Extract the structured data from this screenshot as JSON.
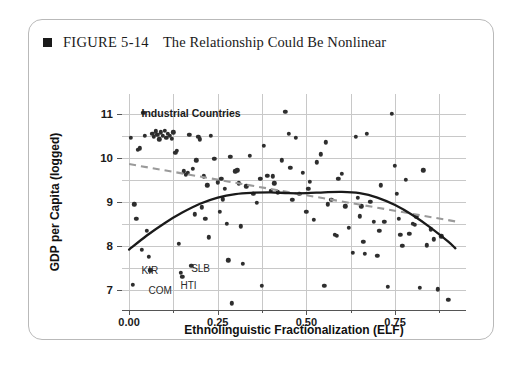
{
  "figure": {
    "bullet": "black-square",
    "number": "FIGURE 5-14",
    "title": "The Relationship Could Be Nonlinear"
  },
  "chart_data": {
    "type": "scatter",
    "title": "The Relationship Could Be Nonlinear",
    "xlabel": "Ethnolinguistic Fractionalization (ELF)",
    "ylabel": "GDP per Capita (logged)",
    "xlim": [
      -0.02,
      0.95
    ],
    "ylim": [
      6.55,
      11.45
    ],
    "xticks": [
      "0.00",
      "0.25",
      "0.50",
      "0.75"
    ],
    "xtick_values": [
      0.0,
      0.25,
      0.5,
      0.75
    ],
    "yticks": [
      "7",
      "8",
      "9",
      "10",
      "11"
    ],
    "ytick_values": [
      7,
      8,
      9,
      10,
      11
    ],
    "grid": true,
    "grid_h_values": [
      7,
      7.5,
      8,
      8.5,
      9,
      9.5,
      10,
      10.5,
      11
    ],
    "grid_v_values": [
      0.0,
      0.125,
      0.25,
      0.375,
      0.5,
      0.625,
      0.75,
      0.875
    ],
    "legend": "none",
    "colors": {
      "point": "#2e2e2e",
      "loess_curve": "#1a1a1a",
      "linear_fit": "#9a9a9a",
      "grid": "#c8c8c8",
      "axis": "#555555",
      "card_border": "#b9b9b9"
    },
    "annotations": [
      {
        "text": "Industrial Countries",
        "x": 0.035,
        "y": 11.16
      },
      {
        "text": "KIR",
        "x": 0.035,
        "y": 7.58
      },
      {
        "text": "SLB",
        "x": 0.175,
        "y": 7.62
      },
      {
        "text": "COM",
        "x": 0.055,
        "y": 7.12
      },
      {
        "text": "HTI",
        "x": 0.145,
        "y": 7.22
      }
    ],
    "points": [
      [
        0.005,
        10.45
      ],
      [
        0.01,
        7.12
      ],
      [
        0.015,
        8.95
      ],
      [
        0.02,
        8.62
      ],
      [
        0.025,
        10.18
      ],
      [
        0.03,
        10.22
      ],
      [
        0.035,
        7.92
      ],
      [
        0.04,
        11.02
      ],
      [
        0.045,
        10.5
      ],
      [
        0.05,
        8.35
      ],
      [
        0.055,
        7.76
      ],
      [
        0.06,
        7.45
      ],
      [
        0.065,
        10.55
      ],
      [
        0.07,
        10.48
      ],
      [
        0.075,
        10.6
      ],
      [
        0.08,
        10.52
      ],
      [
        0.085,
        10.42
      ],
      [
        0.09,
        10.58
      ],
      [
        0.095,
        10.5
      ],
      [
        0.1,
        10.62
      ],
      [
        0.105,
        10.45
      ],
      [
        0.11,
        10.55
      ],
      [
        0.115,
        10.5
      ],
      [
        0.12,
        10.44
      ],
      [
        0.125,
        10.58
      ],
      [
        0.13,
        10.12
      ],
      [
        0.135,
        10.16
      ],
      [
        0.14,
        8.05
      ],
      [
        0.145,
        7.4
      ],
      [
        0.15,
        7.3
      ],
      [
        0.155,
        9.7
      ],
      [
        0.16,
        9.62
      ],
      [
        0.165,
        9.66
      ],
      [
        0.17,
        10.52
      ],
      [
        0.175,
        7.55
      ],
      [
        0.18,
        9.75
      ],
      [
        0.185,
        8.72
      ],
      [
        0.19,
        9.95
      ],
      [
        0.195,
        10.48
      ],
      [
        0.2,
        10.42
      ],
      [
        0.205,
        8.88
      ],
      [
        0.21,
        9.58
      ],
      [
        0.215,
        8.62
      ],
      [
        0.22,
        9.38
      ],
      [
        0.225,
        8.2
      ],
      [
        0.23,
        10.5
      ],
      [
        0.24,
        9.98
      ],
      [
        0.25,
        9.45
      ],
      [
        0.255,
        8.78
      ],
      [
        0.26,
        9.52
      ],
      [
        0.265,
        9.06
      ],
      [
        0.27,
        9.3
      ],
      [
        0.275,
        8.5
      ],
      [
        0.28,
        7.68
      ],
      [
        0.285,
        10.02
      ],
      [
        0.29,
        6.7
      ],
      [
        0.3,
        9.7
      ],
      [
        0.305,
        9.72
      ],
      [
        0.31,
        9.42
      ],
      [
        0.315,
        8.45
      ],
      [
        0.32,
        7.6
      ],
      [
        0.33,
        9.36
      ],
      [
        0.34,
        10.05
      ],
      [
        0.35,
        9.18
      ],
      [
        0.36,
        8.98
      ],
      [
        0.37,
        9.52
      ],
      [
        0.375,
        7.1
      ],
      [
        0.38,
        10.28
      ],
      [
        0.39,
        9.6
      ],
      [
        0.4,
        9.25
      ],
      [
        0.405,
        9.58
      ],
      [
        0.41,
        9.42
      ],
      [
        0.42,
        9.22
      ],
      [
        0.43,
        9.95
      ],
      [
        0.44,
        11.05
      ],
      [
        0.45,
        10.55
      ],
      [
        0.455,
        9.78
      ],
      [
        0.46,
        9.05
      ],
      [
        0.47,
        10.45
      ],
      [
        0.48,
        9.18
      ],
      [
        0.49,
        9.66
      ],
      [
        0.5,
        8.78
      ],
      [
        0.505,
        9.3
      ],
      [
        0.51,
        9.46
      ],
      [
        0.52,
        8.6
      ],
      [
        0.53,
        9.9
      ],
      [
        0.54,
        10.08
      ],
      [
        0.55,
        7.1
      ],
      [
        0.555,
        10.35
      ],
      [
        0.56,
        8.95
      ],
      [
        0.57,
        9.05
      ],
      [
        0.58,
        8.25
      ],
      [
        0.585,
        8.24
      ],
      [
        0.59,
        9.52
      ],
      [
        0.6,
        9.64
      ],
      [
        0.61,
        8.9
      ],
      [
        0.62,
        8.42
      ],
      [
        0.63,
        7.85
      ],
      [
        0.64,
        10.48
      ],
      [
        0.645,
        9.1
      ],
      [
        0.65,
        8.68
      ],
      [
        0.655,
        8.9
      ],
      [
        0.66,
        8.1
      ],
      [
        0.665,
        7.82
      ],
      [
        0.67,
        10.55
      ],
      [
        0.68,
        9.0
      ],
      [
        0.69,
        8.55
      ],
      [
        0.7,
        7.78
      ],
      [
        0.705,
        8.35
      ],
      [
        0.71,
        9.38
      ],
      [
        0.72,
        8.55
      ],
      [
        0.73,
        7.08
      ],
      [
        0.74,
        11.0
      ],
      [
        0.75,
        9.82
      ],
      [
        0.755,
        9.18
      ],
      [
        0.76,
        8.62
      ],
      [
        0.765,
        8.25
      ],
      [
        0.77,
        8.0
      ],
      [
        0.78,
        9.5
      ],
      [
        0.79,
        8.28
      ],
      [
        0.8,
        8.5
      ],
      [
        0.805,
        8.48
      ],
      [
        0.81,
        8.66
      ],
      [
        0.82,
        7.05
      ],
      [
        0.83,
        9.72
      ],
      [
        0.84,
        8.02
      ],
      [
        0.85,
        8.38
      ],
      [
        0.86,
        8.15
      ],
      [
        0.87,
        7.02
      ],
      [
        0.88,
        8.22
      ],
      [
        0.9,
        6.78
      ]
    ],
    "loess_curve": {
      "label": "nonlinear (loess) fit",
      "style": "solid",
      "points": [
        [
          0.0,
          7.92
        ],
        [
          0.05,
          8.24
        ],
        [
          0.1,
          8.52
        ],
        [
          0.15,
          8.76
        ],
        [
          0.2,
          8.96
        ],
        [
          0.25,
          9.1
        ],
        [
          0.3,
          9.18
        ],
        [
          0.35,
          9.21
        ],
        [
          0.4,
          9.22
        ],
        [
          0.45,
          9.2
        ],
        [
          0.5,
          9.2
        ],
        [
          0.55,
          9.22
        ],
        [
          0.6,
          9.23
        ],
        [
          0.65,
          9.2
        ],
        [
          0.7,
          9.1
        ],
        [
          0.75,
          8.93
        ],
        [
          0.8,
          8.7
        ],
        [
          0.85,
          8.42
        ],
        [
          0.9,
          8.1
        ],
        [
          0.92,
          7.95
        ]
      ]
    },
    "linear_fit": {
      "label": "linear (ols) fit",
      "style": "dashed",
      "points": [
        [
          0.0,
          9.86
        ],
        [
          0.92,
          8.56
        ]
      ]
    }
  }
}
